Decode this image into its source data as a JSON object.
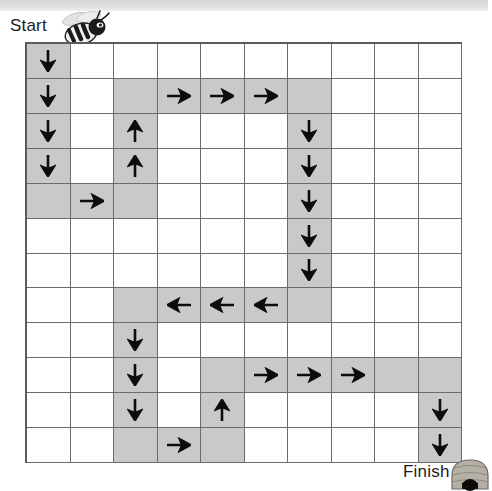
{
  "page": {
    "background_color": "#ffffff",
    "top_band_color": "#d9d9d9"
  },
  "labels": {
    "start": "Start",
    "finish": "Finish"
  },
  "icons": {
    "start_icon": "bee-icon",
    "finish_icon": "beehive-icon"
  },
  "grid": {
    "columns": 10,
    "rows": 12,
    "shaded_color": "#c9c9c9",
    "empty_color": "#ffffff",
    "line_color": "#6b6b6b",
    "arrow_color": "#0d0d0d",
    "arrow_glyphs": {
      "down": "↓",
      "up": "↑",
      "left": "←",
      "right": "→"
    },
    "cells": [
      [
        {
          "shaded": true,
          "arrow": "down"
        },
        {
          "shaded": false,
          "arrow": null
        },
        {
          "shaded": false,
          "arrow": null
        },
        {
          "shaded": false,
          "arrow": null
        },
        {
          "shaded": false,
          "arrow": null
        },
        {
          "shaded": false,
          "arrow": null
        },
        {
          "shaded": false,
          "arrow": null
        },
        {
          "shaded": false,
          "arrow": null
        },
        {
          "shaded": false,
          "arrow": null
        },
        {
          "shaded": false,
          "arrow": null
        }
      ],
      [
        {
          "shaded": true,
          "arrow": "down"
        },
        {
          "shaded": false,
          "arrow": null
        },
        {
          "shaded": true,
          "arrow": null
        },
        {
          "shaded": true,
          "arrow": "right"
        },
        {
          "shaded": true,
          "arrow": "right"
        },
        {
          "shaded": true,
          "arrow": "right"
        },
        {
          "shaded": true,
          "arrow": null
        },
        {
          "shaded": false,
          "arrow": null
        },
        {
          "shaded": false,
          "arrow": null
        },
        {
          "shaded": false,
          "arrow": null
        }
      ],
      [
        {
          "shaded": true,
          "arrow": "down"
        },
        {
          "shaded": false,
          "arrow": null
        },
        {
          "shaded": true,
          "arrow": "up"
        },
        {
          "shaded": false,
          "arrow": null
        },
        {
          "shaded": false,
          "arrow": null
        },
        {
          "shaded": false,
          "arrow": null
        },
        {
          "shaded": true,
          "arrow": "down"
        },
        {
          "shaded": false,
          "arrow": null
        },
        {
          "shaded": false,
          "arrow": null
        },
        {
          "shaded": false,
          "arrow": null
        }
      ],
      [
        {
          "shaded": true,
          "arrow": "down"
        },
        {
          "shaded": false,
          "arrow": null
        },
        {
          "shaded": true,
          "arrow": "up"
        },
        {
          "shaded": false,
          "arrow": null
        },
        {
          "shaded": false,
          "arrow": null
        },
        {
          "shaded": false,
          "arrow": null
        },
        {
          "shaded": true,
          "arrow": "down"
        },
        {
          "shaded": false,
          "arrow": null
        },
        {
          "shaded": false,
          "arrow": null
        },
        {
          "shaded": false,
          "arrow": null
        }
      ],
      [
        {
          "shaded": true,
          "arrow": null
        },
        {
          "shaded": true,
          "arrow": "right"
        },
        {
          "shaded": true,
          "arrow": null
        },
        {
          "shaded": false,
          "arrow": null
        },
        {
          "shaded": false,
          "arrow": null
        },
        {
          "shaded": false,
          "arrow": null
        },
        {
          "shaded": true,
          "arrow": "down"
        },
        {
          "shaded": false,
          "arrow": null
        },
        {
          "shaded": false,
          "arrow": null
        },
        {
          "shaded": false,
          "arrow": null
        }
      ],
      [
        {
          "shaded": false,
          "arrow": null
        },
        {
          "shaded": false,
          "arrow": null
        },
        {
          "shaded": false,
          "arrow": null
        },
        {
          "shaded": false,
          "arrow": null
        },
        {
          "shaded": false,
          "arrow": null
        },
        {
          "shaded": false,
          "arrow": null
        },
        {
          "shaded": true,
          "arrow": "down"
        },
        {
          "shaded": false,
          "arrow": null
        },
        {
          "shaded": false,
          "arrow": null
        },
        {
          "shaded": false,
          "arrow": null
        }
      ],
      [
        {
          "shaded": false,
          "arrow": null
        },
        {
          "shaded": false,
          "arrow": null
        },
        {
          "shaded": false,
          "arrow": null
        },
        {
          "shaded": false,
          "arrow": null
        },
        {
          "shaded": false,
          "arrow": null
        },
        {
          "shaded": false,
          "arrow": null
        },
        {
          "shaded": true,
          "arrow": "down"
        },
        {
          "shaded": false,
          "arrow": null
        },
        {
          "shaded": false,
          "arrow": null
        },
        {
          "shaded": false,
          "arrow": null
        }
      ],
      [
        {
          "shaded": false,
          "arrow": null
        },
        {
          "shaded": false,
          "arrow": null
        },
        {
          "shaded": true,
          "arrow": null
        },
        {
          "shaded": true,
          "arrow": "left"
        },
        {
          "shaded": true,
          "arrow": "left"
        },
        {
          "shaded": true,
          "arrow": "left"
        },
        {
          "shaded": true,
          "arrow": null
        },
        {
          "shaded": false,
          "arrow": null
        },
        {
          "shaded": false,
          "arrow": null
        },
        {
          "shaded": false,
          "arrow": null
        }
      ],
      [
        {
          "shaded": false,
          "arrow": null
        },
        {
          "shaded": false,
          "arrow": null
        },
        {
          "shaded": true,
          "arrow": "down"
        },
        {
          "shaded": false,
          "arrow": null
        },
        {
          "shaded": false,
          "arrow": null
        },
        {
          "shaded": false,
          "arrow": null
        },
        {
          "shaded": false,
          "arrow": null
        },
        {
          "shaded": false,
          "arrow": null
        },
        {
          "shaded": false,
          "arrow": null
        },
        {
          "shaded": false,
          "arrow": null
        }
      ],
      [
        {
          "shaded": false,
          "arrow": null
        },
        {
          "shaded": false,
          "arrow": null
        },
        {
          "shaded": true,
          "arrow": "down"
        },
        {
          "shaded": false,
          "arrow": null
        },
        {
          "shaded": true,
          "arrow": null
        },
        {
          "shaded": true,
          "arrow": "right"
        },
        {
          "shaded": true,
          "arrow": "right"
        },
        {
          "shaded": true,
          "arrow": "right"
        },
        {
          "shaded": true,
          "arrow": null
        },
        {
          "shaded": true,
          "arrow": null
        }
      ],
      [
        {
          "shaded": false,
          "arrow": null
        },
        {
          "shaded": false,
          "arrow": null
        },
        {
          "shaded": true,
          "arrow": "down"
        },
        {
          "shaded": false,
          "arrow": null
        },
        {
          "shaded": true,
          "arrow": "up"
        },
        {
          "shaded": false,
          "arrow": null
        },
        {
          "shaded": false,
          "arrow": null
        },
        {
          "shaded": false,
          "arrow": null
        },
        {
          "shaded": false,
          "arrow": null
        },
        {
          "shaded": true,
          "arrow": "down"
        }
      ],
      [
        {
          "shaded": false,
          "arrow": null
        },
        {
          "shaded": false,
          "arrow": null
        },
        {
          "shaded": true,
          "arrow": null
        },
        {
          "shaded": true,
          "arrow": "right"
        },
        {
          "shaded": true,
          "arrow": null
        },
        {
          "shaded": false,
          "arrow": null
        },
        {
          "shaded": false,
          "arrow": null
        },
        {
          "shaded": false,
          "arrow": null
        },
        {
          "shaded": false,
          "arrow": null
        },
        {
          "shaded": true,
          "arrow": "down"
        }
      ]
    ]
  }
}
